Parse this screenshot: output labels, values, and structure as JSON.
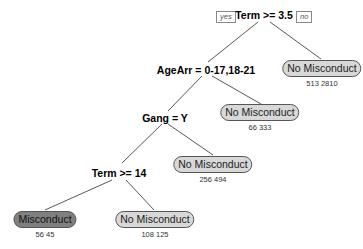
{
  "tree": {
    "branch_labels": {
      "left": "yes",
      "right": "no"
    },
    "splits": [
      {
        "id": "root",
        "label": "Term >= 3.5"
      },
      {
        "id": "age",
        "label": "AgeArr = 0-17,18-21"
      },
      {
        "id": "gang",
        "label": "Gang = Y"
      },
      {
        "id": "term14",
        "label": "Term >= 14"
      }
    ],
    "leaves": [
      {
        "id": "leaf1",
        "label": "No Misconduct",
        "counts": "513  2810"
      },
      {
        "id": "leaf2",
        "label": "No Misconduct",
        "counts": "66  333"
      },
      {
        "id": "leaf3",
        "label": "No Misconduct",
        "counts": "256  494"
      },
      {
        "id": "leaf4",
        "label": "Misconduct",
        "counts": "56  45"
      },
      {
        "id": "leaf5",
        "label": "No Misconduct",
        "counts": "108  125"
      }
    ],
    "colors": {
      "leaf_light": "#d8d8d8",
      "leaf_dark": "#808080",
      "edge": "#444444"
    }
  }
}
